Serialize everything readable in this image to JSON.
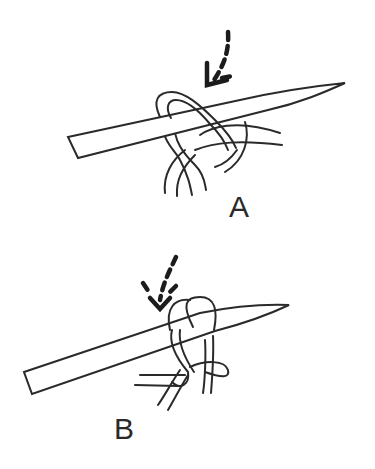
{
  "figure": {
    "type": "knitting-stitch-illustration",
    "panels": [
      {
        "id": "A",
        "label": "A",
        "description": "Needle inserted through stitch loop; dashed arrow pointing down-left toward front of loop"
      },
      {
        "id": "B",
        "label": "B",
        "description": "Loop twisted around needle; dashed arrow pointing straight down onto loop"
      }
    ]
  },
  "colors": {
    "line": "#2a2a2a",
    "background": "#ffffff"
  }
}
